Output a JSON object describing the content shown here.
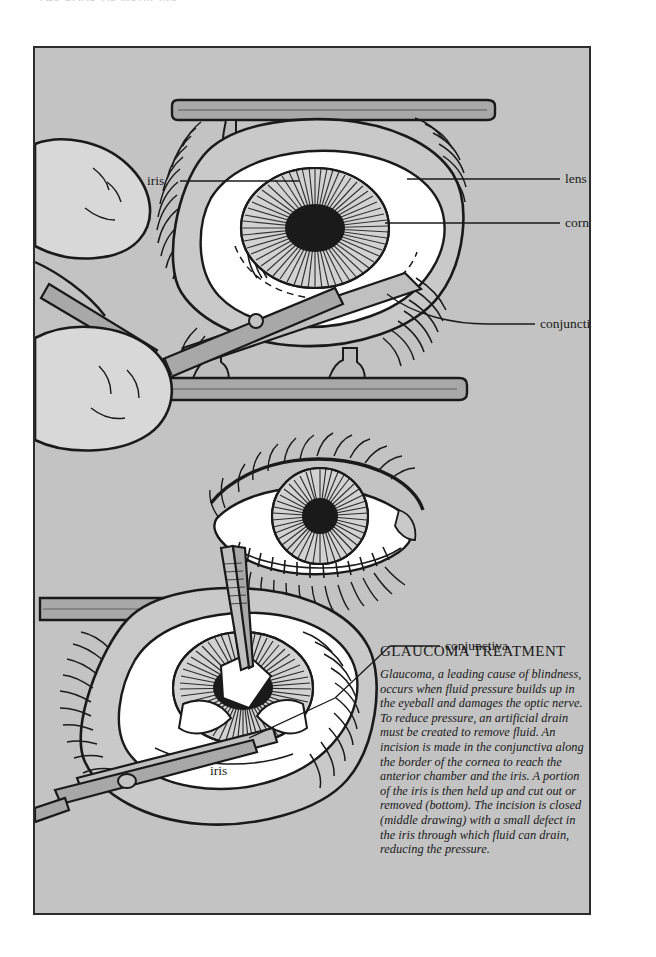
{
  "page": {
    "clipped_header_text": "THE BOOK OF MEDICINE",
    "background_color": "#ffffff"
  },
  "plate": {
    "background_color": "#c3c3c3",
    "border_color": "#2c2c2c",
    "skin_fill": "#d8d8d8",
    "instrument_fill": "#a8a8a8",
    "sclera_fill": "#ffffff",
    "pupil_fill": "#1a1a1a",
    "ink_color": "#1a1a1a"
  },
  "labels": {
    "iris_top": "iris",
    "lens": "lens",
    "cornea": "cornea",
    "conjunctiva_top": "conjunctiva",
    "conjunctiva_bottom": "conjunctiva",
    "iris_bottom": "iris"
  },
  "caption": {
    "title": "GLAUCOMA TREATMENT",
    "body": "Glaucoma, a leading cause of blindness, occurs when fluid pressure builds up in the eyeball and damages the optic nerve. To reduce pressure, an artificial drain must be created to remove fluid. An incision is made in the conjunctiva along the border of the cornea to reach the anterior chamber and the iris. A portion of the iris is then held up and cut out or removed (bottom). The incision is closed (middle drawing) with a small defect in the iris through which fluid can drain, reducing the pressure."
  },
  "figures": {
    "top": "surgical-eye-incision-with-scissors-and-speculum",
    "middle": "closed-eye-with-sutures",
    "bottom": "iris-excision-with-forceps-and-scissors"
  }
}
